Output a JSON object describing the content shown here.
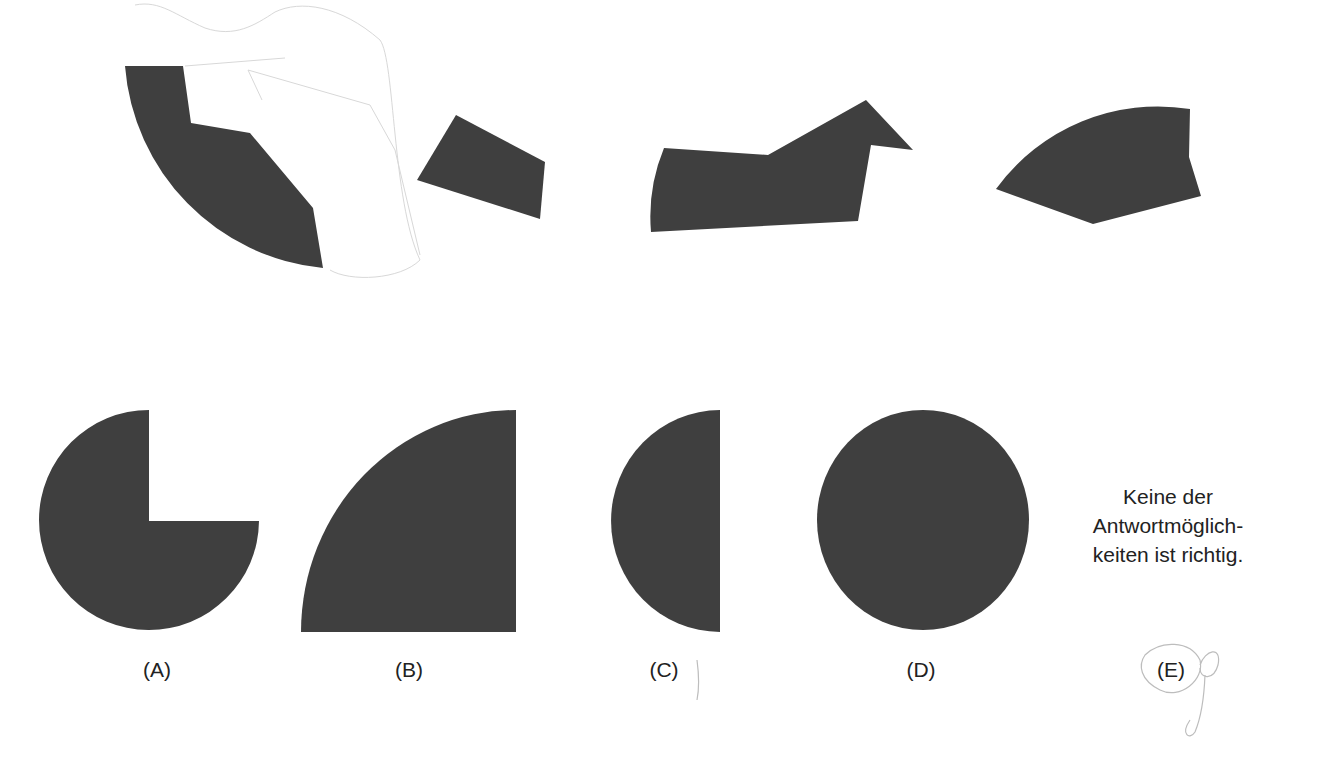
{
  "puzzle": {
    "description": "Spatial reasoning task: which shape results from combining the four pieces shown above",
    "pieces": [
      {
        "id": "piece-1",
        "shape": "circle-segment-with-notched-edge"
      },
      {
        "id": "piece-2",
        "shape": "quadrilateral"
      },
      {
        "id": "piece-3",
        "shape": "arc-edged-polygon-with-point"
      },
      {
        "id": "piece-4",
        "shape": "arc-edged-wedge"
      }
    ],
    "fill_color": "#3f3f3f",
    "answers": [
      {
        "label": "(A)",
        "shape": "three-quarter-circle"
      },
      {
        "label": "(B)",
        "shape": "quarter-circle"
      },
      {
        "label": "(C)",
        "shape": "half-circle"
      },
      {
        "label": "(D)",
        "shape": "full-circle"
      },
      {
        "label": "(E)",
        "text_lines": [
          "Keine der",
          "Antwortmöglich-",
          "keiten ist richtig."
        ],
        "handwritten_mark": "circled"
      }
    ]
  }
}
